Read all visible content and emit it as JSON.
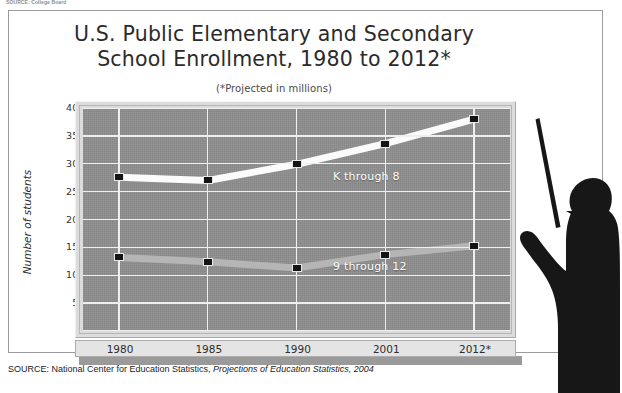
{
  "top_credit": "SOURCE: College Board",
  "title": {
    "line1": "U.S. Public Elementary and Secondary",
    "line2": "School Enrollment, 1980 to 2012*"
  },
  "subtitle": "(*Projected in millions)",
  "source": {
    "prefix": "SOURCE: National Center for Education Statistics, ",
    "italic": "Projections of Education Statistics, 2004"
  },
  "axis": {
    "y_title": "Number of students",
    "y_ticks": [
      "40M",
      "35M",
      "30M",
      "25M",
      "20M",
      "15M",
      "10M",
      "5M",
      "0"
    ],
    "x_ticks": [
      "1980",
      "1985",
      "1990",
      "2001",
      "2012*"
    ]
  },
  "series_labels": {
    "k8": "K through 8",
    "g912": "9 through 12"
  },
  "colors": {
    "plot_background": "#8d8d8d",
    "gridline": "#efefef",
    "series_k8": "#fbfbfb",
    "series_912": "#b5b5b5",
    "marker": "#141414",
    "frame": "#dcdcdc",
    "silhouette": "#171717"
  },
  "chart_data": {
    "type": "line",
    "title": "U.S. Public Elementary and Secondary School Enrollment, 1980 to 2012*",
    "subtitle": "(*Projected in millions)",
    "xlabel": "",
    "ylabel": "Number of students",
    "categories": [
      "1980",
      "1985",
      "1990",
      "2001",
      "2012*"
    ],
    "ylim": [
      0,
      40
    ],
    "yticks": [
      0,
      5,
      10,
      15,
      20,
      25,
      30,
      35,
      40
    ],
    "y_unit": "millions",
    "grid": true,
    "legend": "inline-labels",
    "series": [
      {
        "name": "K through 8",
        "values": [
          27.6,
          27.0,
          29.9,
          33.6,
          38.0
        ]
      },
      {
        "name": "9 through 12",
        "values": [
          13.2,
          12.4,
          11.3,
          13.7,
          15.3
        ]
      }
    ]
  }
}
